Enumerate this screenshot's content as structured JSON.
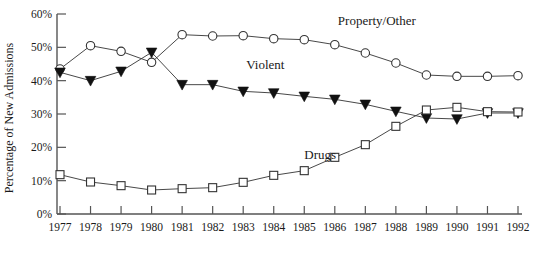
{
  "chart_data": {
    "type": "line",
    "title": "",
    "xlabel": "",
    "ylabel": "Percentage of New Admissions",
    "ylim": [
      0,
      60
    ],
    "xlim": [
      1977,
      1992
    ],
    "grid": false,
    "legend_position": "inline-annotations",
    "categories": [
      1977,
      1978,
      1979,
      1980,
      1981,
      1982,
      1983,
      1984,
      1985,
      1986,
      1987,
      1988,
      1989,
      1990,
      1991,
      1992
    ],
    "x_tick_labels": [
      "1977",
      "1978",
      "1979",
      "1980",
      "1981",
      "1982",
      "1983",
      "1984",
      "1985",
      "1986",
      "1987",
      "1988",
      "1989",
      "1990",
      "1991",
      "1992"
    ],
    "y_tick_labels": [
      "0%",
      "10%",
      "20%",
      "30%",
      "40%",
      "50%",
      "60%"
    ],
    "y_tick_values": [
      0,
      10,
      20,
      30,
      40,
      50,
      60
    ],
    "series": [
      {
        "name": "Property/Other",
        "marker": "open-circle",
        "label": "Property/Other",
        "label_x": 1986.1,
        "label_y": 56.6,
        "values": [
          43.5,
          50.5,
          48.8,
          45.5,
          53.8,
          53.4,
          53.5,
          52.6,
          52.3,
          50.8,
          48.3,
          45.3,
          41.7,
          41.3,
          41.3,
          41.5
        ]
      },
      {
        "name": "Violent",
        "marker": "filled-triangle",
        "label": "Violent",
        "label_x": 1983.1,
        "label_y": 43.4,
        "values": [
          42.5,
          40.0,
          42.8,
          48.5,
          38.8,
          38.8,
          36.8,
          36.3,
          35.3,
          34.4,
          32.9,
          30.8,
          28.8,
          28.5,
          30.3,
          30.3
        ]
      },
      {
        "name": "Drugs",
        "marker": "open-square",
        "label": "Drugs",
        "label_x": 1985.0,
        "label_y": 16.5,
        "values": [
          11.8,
          9.6,
          8.5,
          7.2,
          7.6,
          7.9,
          9.5,
          11.6,
          13.0,
          17.0,
          20.8,
          26.3,
          31.2,
          32.0,
          30.7,
          30.6
        ]
      }
    ]
  }
}
